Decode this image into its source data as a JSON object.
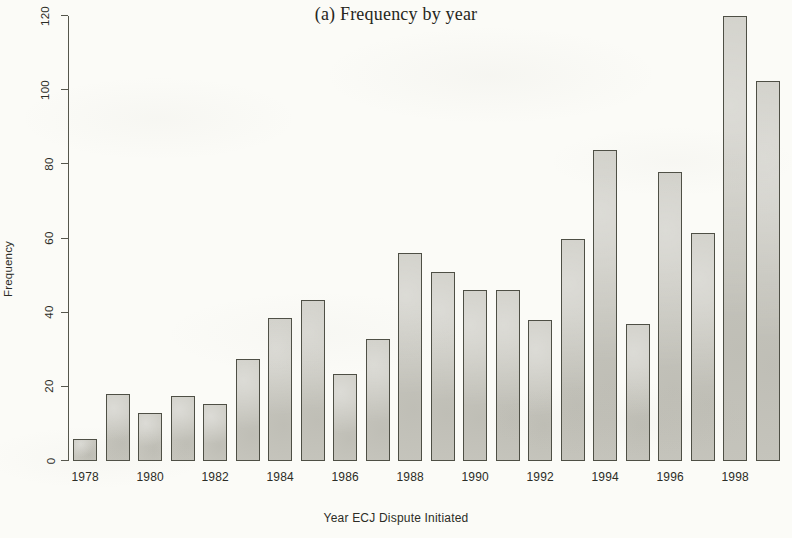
{
  "chart_data": {
    "type": "bar",
    "title": "(a) Frequency by year",
    "xlabel": "Year ECJ Dispute Initiated",
    "ylabel": "Frequency",
    "ylim": [
      0,
      120
    ],
    "y_ticks": [
      0,
      20,
      40,
      60,
      80,
      100,
      120
    ],
    "x_ticks": [
      1978,
      1980,
      1982,
      1984,
      1986,
      1988,
      1990,
      1992,
      1994,
      1996,
      1998
    ],
    "grid": false,
    "legend": "none",
    "categories": [
      1978,
      1979,
      1980,
      1981,
      1982,
      1983,
      1984,
      1985,
      1986,
      1987,
      1988,
      1989,
      1990,
      1991,
      1992,
      1993,
      1994,
      1995,
      1996,
      1997,
      1998,
      1999
    ],
    "values": [
      6,
      18,
      13,
      17.5,
      15.5,
      27.5,
      38.5,
      43.5,
      23.5,
      33,
      56,
      51,
      46,
      46,
      38,
      60,
      84,
      37,
      78,
      61.5,
      120,
      102.5
    ],
    "bar_fill_color": "#c9c8c0",
    "bar_border_color": "#4e4f45",
    "axis_color": "#55564c",
    "background_color": "#fbfbf7",
    "text_color": "#2c2c26"
  }
}
